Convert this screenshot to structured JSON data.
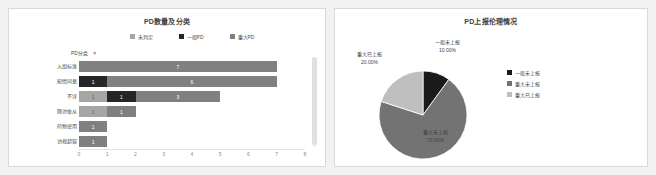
{
  "bar_card": {
    "title": "PD数量及分类",
    "axis_caption": "PD分类",
    "filter_icon": "funnel-icon",
    "legend": [
      {
        "label": "未判定",
        "color": "#a6a6a6"
      },
      {
        "label": "一般PD",
        "color": "#262626"
      },
      {
        "label": "重大PD",
        "color": "#808080"
      }
    ]
  },
  "pie_card": {
    "title": "PD上报伦理情况",
    "legend": [
      {
        "label": "一般未上报",
        "color": "#1a1a1a"
      },
      {
        "label": "重大未上报",
        "color": "#737373"
      },
      {
        "label": "重大已上报",
        "color": "#bfbfbf"
      }
    ]
  },
  "chart_data": [
    {
      "type": "bar",
      "orientation": "horizontal",
      "stacked": true,
      "title": "PD数量及分类",
      "xlabel": "",
      "ylabel": "PD分类",
      "xlim": [
        0,
        8
      ],
      "xticks": [
        "0",
        "1",
        "2",
        "3",
        "4",
        "5",
        "6",
        "7",
        "8"
      ],
      "grid": false,
      "legend_position": "top",
      "categories": [
        "入组标准",
        "知情同意",
        "不详",
        "随访依从",
        "药物使用",
        "访视超窗"
      ],
      "series": [
        {
          "name": "未判定",
          "color": "#a6a6a6",
          "values": [
            0,
            0,
            1,
            1,
            1,
            1
          ]
        },
        {
          "name": "一般PD",
          "color": "#262626",
          "values": [
            0,
            1,
            1,
            1,
            0,
            0
          ]
        },
        {
          "name": "重大PD",
          "color": "#808080",
          "values": [
            7,
            6,
            3,
            0,
            0,
            0
          ]
        }
      ],
      "bar_labels": [
        [
          {
            "text": "7",
            "color": "#808080",
            "width": 7
          }
        ],
        [
          {
            "text": "1",
            "color": "#262626",
            "width": 1
          },
          {
            "text": "6",
            "color": "#808080",
            "width": 6
          }
        ],
        [
          {
            "text": "1",
            "color": "#a6a6a6",
            "width": 1
          },
          {
            "text": "1",
            "color": "#262626",
            "width": 1
          },
          {
            "text": "3",
            "color": "#808080",
            "width": 3
          }
        ],
        [
          {
            "text": "1",
            "color": "#a6a6a6",
            "width": 1
          },
          {
            "text": "1",
            "color": "#808080",
            "width": 1
          }
        ],
        [
          {
            "text": "1",
            "color": "#808080",
            "width": 1
          }
        ],
        [
          {
            "text": "1",
            "color": "#808080",
            "width": 1
          }
        ]
      ]
    },
    {
      "type": "pie",
      "title": "PD上报伦理情况",
      "legend_position": "right",
      "labels": [
        "一般未上报",
        "重大未上报",
        "重大已上报"
      ],
      "values": [
        10,
        70,
        20
      ],
      "percent_labels": [
        "10.00%",
        "70.00%",
        "20.00%"
      ],
      "colors": [
        "#1a1a1a",
        "#737373",
        "#bfbfbf"
      ]
    }
  ]
}
